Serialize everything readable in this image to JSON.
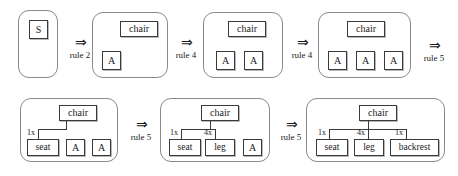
{
  "diagram": {
    "arrow_glyph": "⇒",
    "colors": {
      "panel_border": "#8a8a8a",
      "box_border": "#3a3a3a",
      "box_fill": "#ffffff",
      "line": "#3a3a3a",
      "text": "#1a1a1a",
      "background": "#ffffff"
    },
    "steps": [
      {
        "id": "step-1",
        "boxes": [
          {
            "label": "S",
            "kind": "nonterminal"
          }
        ]
      },
      {
        "id": "step-2",
        "boxes": [
          {
            "label": "chair",
            "kind": "nonterminal"
          },
          {
            "label": "A",
            "kind": "nonterminal"
          }
        ]
      },
      {
        "id": "step-3",
        "boxes": [
          {
            "label": "chair",
            "kind": "nonterminal"
          },
          {
            "label": "A",
            "kind": "nonterminal"
          },
          {
            "label": "A",
            "kind": "nonterminal"
          }
        ]
      },
      {
        "id": "step-4",
        "boxes": [
          {
            "label": "chair",
            "kind": "nonterminal"
          },
          {
            "label": "A",
            "kind": "nonterminal"
          },
          {
            "label": "A",
            "kind": "nonterminal"
          },
          {
            "label": "A",
            "kind": "nonterminal"
          }
        ]
      },
      {
        "id": "step-5",
        "root": "chair",
        "children": [
          {
            "label": "seat",
            "mult": "1x"
          },
          {
            "label": "A",
            "mult": ""
          },
          {
            "label": "A",
            "mult": ""
          }
        ]
      },
      {
        "id": "step-6",
        "root": "chair",
        "children": [
          {
            "label": "seat",
            "mult": "1x"
          },
          {
            "label": "leg",
            "mult": "4x"
          },
          {
            "label": "A",
            "mult": ""
          }
        ]
      },
      {
        "id": "step-7",
        "root": "chair",
        "children": [
          {
            "label": "seat",
            "mult": "1x"
          },
          {
            "label": "leg",
            "mult": "4x"
          },
          {
            "label": "backrest",
            "mult": "1x"
          }
        ]
      }
    ],
    "transitions": [
      {
        "id": "t1",
        "glyph": "⇒",
        "rule": "rule 2"
      },
      {
        "id": "t2",
        "glyph": "⇒",
        "rule": "rule 4"
      },
      {
        "id": "t3",
        "glyph": "⇒",
        "rule": "rule 4"
      },
      {
        "id": "t4",
        "glyph": "⇒",
        "rule": "rule 5"
      },
      {
        "id": "t5",
        "glyph": "⇒",
        "rule": "rule 5"
      },
      {
        "id": "t6",
        "glyph": "⇒",
        "rule": "rule 5"
      }
    ]
  }
}
